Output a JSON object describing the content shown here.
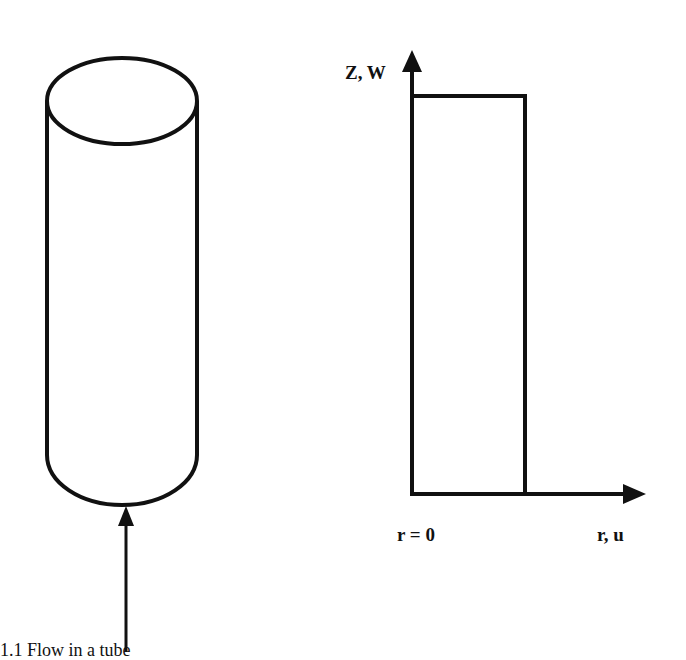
{
  "figure": {
    "left_panel": {
      "shape": "cylinder",
      "arrow": "upward-flow-arrow"
    },
    "right_panel": {
      "vertical_axis_label": "Z, W",
      "horizontal_axis_label": "r, u",
      "origin_label": "r = 0",
      "profile": "uniform-rectangular-velocity-profile"
    },
    "caption_fragment": "1.1   Flow in a tube"
  },
  "colors": {
    "stroke": "#111111",
    "background": "#ffffff"
  }
}
